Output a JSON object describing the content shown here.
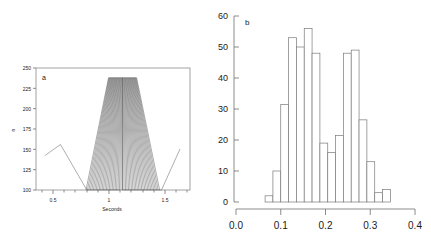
{
  "figure": {
    "background": "#ffffff",
    "line_color": "#4a4a4a",
    "axis_color": "#6e6e6e",
    "bar_edge_color": "#7a7a7a",
    "bar_fill_color": "#ffffff"
  },
  "chart_data": [
    {
      "id": "panel-a",
      "type": "line",
      "panel_label": "a",
      "title": "",
      "xlabel": "Seconds",
      "ylabel": "n",
      "xlim": [
        0.35,
        1.72
      ],
      "ylim": [
        100,
        250
      ],
      "xticks": [
        0.5,
        1,
        1.5
      ],
      "xticklabels": [
        "0.5",
        "1",
        "1.5"
      ],
      "yticks": [
        100,
        125,
        150,
        175,
        200,
        225,
        250
      ],
      "yticklabels": [
        "100",
        "125",
        "150",
        "175",
        "200",
        "225",
        "250"
      ],
      "minor_xticks": [
        0.4,
        0.6,
        0.7,
        0.8,
        0.9,
        1.1,
        1.2,
        1.3,
        1.4,
        1.6,
        1.7
      ],
      "grid": false,
      "legend": null,
      "baseline_value": 100,
      "plateau_value": 238,
      "description": "Overlaid V-shaped trajectories forming a trapezoidal fan; flat baseline at 100 with a single peak near 0.62 s reaching about 160, rising limbs between about 0.78 and 1.12 s and falling limbs between about 1.12 and 1.45 s, plus a terminal rise after 1.45 s",
      "series": [
        {
          "name": "envelope-outer-left",
          "x": [
            0.42,
            0.62,
            0.78,
            0.8,
            1.0,
            1.12,
            1.23,
            1.45,
            1.62
          ],
          "y": [
            140,
            160,
            100,
            100,
            238,
            238,
            238,
            100,
            152
          ]
        },
        {
          "name": "envelope-outer-right",
          "x": [
            0.8,
            1.0,
            1.12,
            1.24,
            1.45
          ],
          "y": [
            100,
            238,
            238,
            238,
            100
          ]
        }
      ],
      "fan": {
        "n_lines": 26,
        "apex_y": 100,
        "top_y": 238,
        "left_foot_x": 0.795,
        "right_foot_x": 1.45,
        "left_top_x": 0.995,
        "right_top_x": 1.245,
        "notch_x": 1.12,
        "notch_y": 100
      }
    },
    {
      "id": "panel-b",
      "type": "bar",
      "subtype": "histogram",
      "panel_label": "b",
      "title": "",
      "xlabel": "",
      "ylabel": "",
      "xlim": [
        0.0,
        0.4
      ],
      "ylim": [
        0,
        60
      ],
      "xticks": [
        0.0,
        0.1,
        0.2,
        0.3,
        0.4
      ],
      "xticklabels": [
        "0.0",
        "0.1",
        "0.2",
        "0.3",
        "0.4"
      ],
      "yticks": [
        0,
        10,
        20,
        30,
        40,
        50,
        60
      ],
      "yticklabels": [
        "0",
        "10",
        "20",
        "30",
        "40",
        "50",
        "60"
      ],
      "grid": false,
      "legend": null,
      "bin_width": 0.0175,
      "bin_edges": [
        0.065,
        0.0825,
        0.1,
        0.1175,
        0.135,
        0.1525,
        0.17,
        0.1875,
        0.205,
        0.2225,
        0.24,
        0.2575,
        0.275,
        0.2925,
        0.31,
        0.3275,
        0.345,
        0.3625
      ],
      "categories": [
        "0.065",
        "0.083",
        "0.100",
        "0.118",
        "0.135",
        "0.153",
        "0.170",
        "0.188",
        "0.205",
        "0.223",
        "0.240",
        "0.258",
        "0.275",
        "0.293",
        "0.310",
        "0.328",
        "0.345"
      ],
      "values": [
        2,
        10,
        31.5,
        53,
        50,
        56,
        48,
        19,
        16,
        21.5,
        48,
        49,
        26.5,
        13,
        3,
        4,
        0
      ]
    }
  ]
}
